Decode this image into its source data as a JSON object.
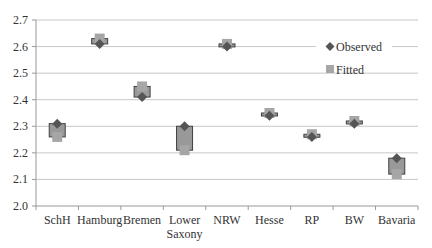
{
  "chart_data": {
    "type": "scatter",
    "title": "",
    "xlabel": "",
    "ylabel": "",
    "ylim": [
      2.0,
      2.7
    ],
    "yticks": [
      "2.0",
      "2.1",
      "2.2",
      "2.3",
      "2.4",
      "2.5",
      "2.6",
      "2.7"
    ],
    "grid": true,
    "legend_position": "right-top-inside",
    "categories": [
      "SchH",
      "Hamburg",
      "Bremen",
      "Lower Saxony",
      "NRW",
      "Hesse",
      "RP",
      "BW",
      "Bavaria"
    ],
    "category_labels": [
      [
        "SchH"
      ],
      [
        "Hamburg"
      ],
      [
        "Bremen"
      ],
      [
        "Lower",
        "Saxony"
      ],
      [
        "NRW"
      ],
      [
        "Hesse"
      ],
      [
        "RP"
      ],
      [
        "BW"
      ],
      [
        "Bavaria"
      ]
    ],
    "series": [
      {
        "name": "Observed",
        "marker": "diamond",
        "color": "#555555",
        "values": [
          2.31,
          2.61,
          2.41,
          2.3,
          2.6,
          2.34,
          2.26,
          2.31,
          2.18
        ]
      },
      {
        "name": "Fitted",
        "marker": "square",
        "color": "#a6a6a6",
        "values": [
          2.26,
          2.63,
          2.45,
          2.21,
          2.61,
          2.35,
          2.27,
          2.32,
          2.12
        ]
      }
    ],
    "box_color": "#999999",
    "box_border": "#404040"
  },
  "legend": {
    "observed_label": "Observed",
    "fitted_label": "Fitted"
  }
}
